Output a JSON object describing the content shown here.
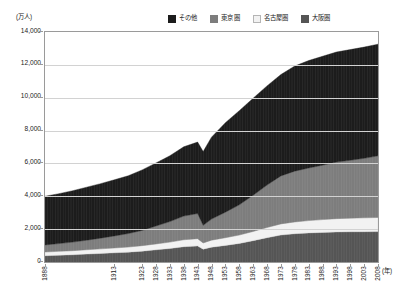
{
  "chart_data": {
    "type": "area",
    "stacked": true,
    "title": "",
    "subtitle": "",
    "xlabel": "(年)",
    "ylabel": "(万人)",
    "ylim": [
      0,
      14000
    ],
    "ytick_step": 2000,
    "ytick_labels": [
      "14,000",
      "12,000",
      "10,000",
      "8,000",
      "6,000",
      "4,000",
      "2,000",
      "0"
    ],
    "ytick_values": [
      14000,
      12000,
      10000,
      8000,
      6000,
      4000,
      2000,
      0
    ],
    "grid": true,
    "legend_position": "top-right",
    "stack_order_bottom_to_top": [
      "大阪圏",
      "名古屋圏",
      "東京圏",
      "その他"
    ],
    "xlim": [
      1888,
      2008
    ],
    "xtick_labels": [
      "1888",
      "1913",
      "1923",
      "1928",
      "1933",
      "1938",
      "1943",
      "1948",
      "1953",
      "1958",
      "1963",
      "1968",
      "1973",
      "1978",
      "1983",
      "1988",
      "1993",
      "1998",
      "2003",
      "2008"
    ],
    "x": [
      1888,
      1893,
      1898,
      1903,
      1908,
      1913,
      1918,
      1923,
      1928,
      1933,
      1938,
      1943,
      1945,
      1948,
      1953,
      1958,
      1963,
      1968,
      1973,
      1978,
      1983,
      1988,
      1993,
      1998,
      2003,
      2008
    ],
    "series": [
      {
        "name": "大阪圏",
        "color": "#555555",
        "values": [
          380,
          410,
          440,
          480,
          520,
          560,
          600,
          660,
          740,
          820,
          930,
          980,
          780,
          900,
          1010,
          1130,
          1300,
          1480,
          1640,
          1720,
          1770,
          1800,
          1830,
          1840,
          1845,
          1850
        ]
      },
      {
        "name": "名古屋圏",
        "color": "#f2f2f2",
        "values": [
          230,
          240,
          250,
          265,
          280,
          295,
          310,
          335,
          360,
          390,
          425,
          440,
          380,
          430,
          470,
          510,
          560,
          620,
          680,
          720,
          750,
          780,
          810,
          830,
          845,
          860
        ]
      },
      {
        "name": "東京圏",
        "color": "#7d7d7d",
        "values": [
          430,
          470,
          520,
          580,
          650,
          730,
          820,
          930,
          1090,
          1250,
          1440,
          1530,
          1070,
          1280,
          1550,
          1840,
          2200,
          2580,
          2920,
          3090,
          3200,
          3310,
          3440,
          3520,
          3620,
          3750
        ]
      },
      {
        "name": "その他",
        "color": "#1c1c1c",
        "values": [
          2960,
          3040,
          3130,
          3230,
          3320,
          3420,
          3520,
          3680,
          3840,
          4010,
          4220,
          4350,
          4490,
          4990,
          5450,
          5730,
          5910,
          6040,
          6170,
          6400,
          6540,
          6630,
          6700,
          6740,
          6770,
          6800
        ]
      }
    ],
    "totals": [
      4000,
      4160,
      4340,
      4555,
      4770,
      5005,
      5250,
      5605,
      6030,
      6470,
      7015,
      7300,
      6720,
      7600,
      8480,
      9210,
      9970,
      10720,
      11410,
      11930,
      12260,
      12520,
      12780,
      12930,
      13080,
      13260
    ]
  },
  "legend": {
    "items": [
      {
        "label": "その他",
        "swatch": "legend-swatch-other"
      },
      {
        "label": "東京圏",
        "swatch": "legend-swatch-tokyo"
      },
      {
        "label": "名古屋圏",
        "swatch": "legend-swatch-nagoya"
      },
      {
        "label": "大阪圏",
        "swatch": "legend-swatch-osaka"
      }
    ]
  },
  "axis": {
    "y_unit": "(万人)",
    "x_unit": "(年)"
  }
}
